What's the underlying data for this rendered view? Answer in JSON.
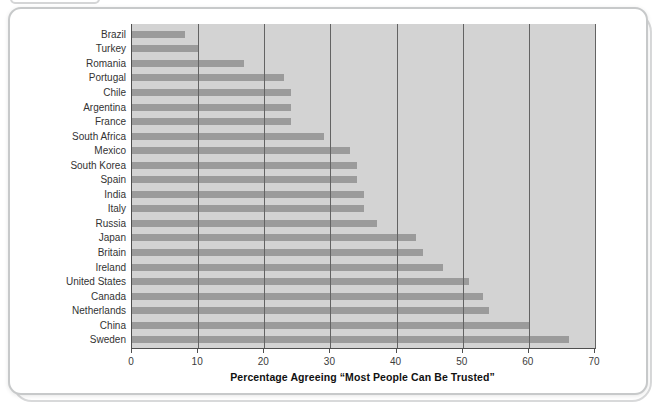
{
  "chart_data": {
    "type": "bar",
    "orientation": "horizontal",
    "xlabel": "Percentage Agreeing “Most People Can Be Trusted”",
    "xlim": [
      0,
      70
    ],
    "x_ticks": [
      0,
      10,
      20,
      30,
      40,
      50,
      60,
      70
    ],
    "grid": true,
    "legend": false,
    "categories": [
      "Brazil",
      "Turkey",
      "Romania",
      "Portugal",
      "Chile",
      "Argentina",
      "France",
      "South Africa",
      "Mexico",
      "South Korea",
      "Spain",
      "India",
      "Italy",
      "Russia",
      "Japan",
      "Britain",
      "Ireland",
      "United States",
      "Canada",
      "Netherlands",
      "China",
      "Sweden"
    ],
    "values": [
      8,
      10,
      17,
      23,
      24,
      24,
      24,
      29,
      33,
      34,
      34,
      35,
      35,
      37,
      43,
      44,
      47,
      51,
      53,
      54,
      60,
      66
    ],
    "colors": {
      "bar": "#9b9b9b",
      "plot_background": "#d3d3d3",
      "gridline": "#636363",
      "axis_line": "#4f4f4f",
      "tick_label": "#3c3c3c",
      "category_label": "#333333",
      "axis_title": "#111111",
      "card_border": "#c7c9ca",
      "page_background": "#ffffff"
    }
  }
}
